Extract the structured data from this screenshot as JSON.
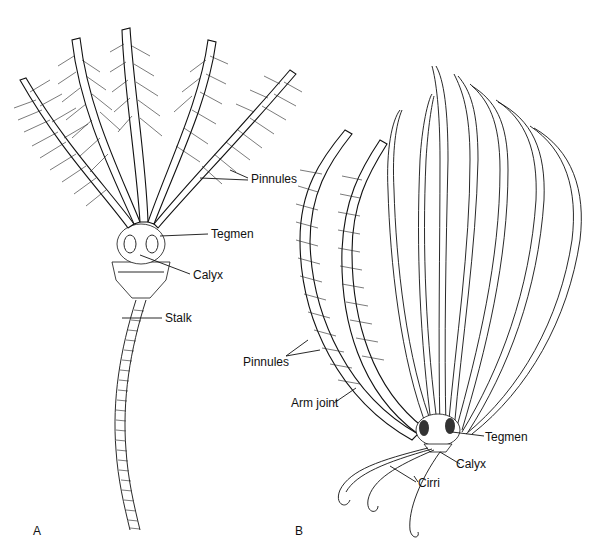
{
  "figure": {
    "panels": [
      {
        "id": "A",
        "label": "A",
        "callouts": {
          "pinnules": "Pinnules",
          "tegmen": "Tegmen",
          "calyx": "Calyx",
          "stalk": "Stalk"
        }
      },
      {
        "id": "B",
        "label": "B",
        "callouts": {
          "pinnules": "Pinnules",
          "arm_joint": "Arm joint",
          "tegmen": "Tegmen",
          "calyx": "Calyx",
          "cirri": "Cirri"
        }
      }
    ]
  }
}
